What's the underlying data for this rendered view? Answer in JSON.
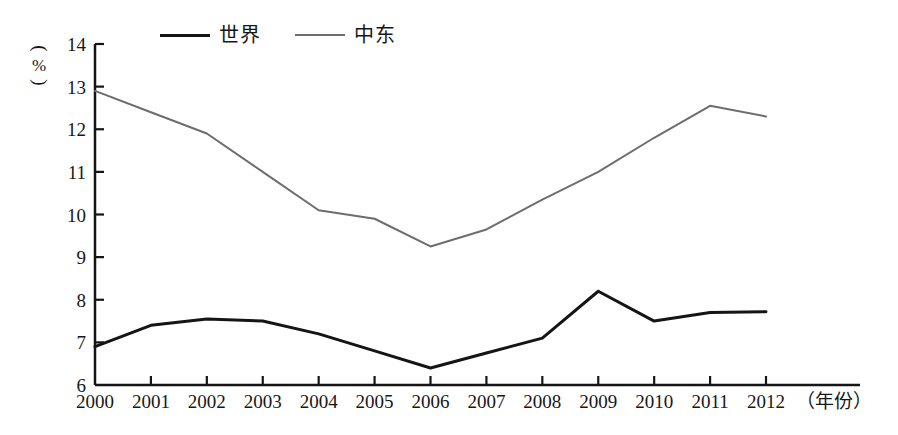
{
  "chart_data": {
    "type": "line",
    "title": "",
    "subtitle": "",
    "xlabel": "（年份）",
    "ylabel": "（%）",
    "ylim": [
      6,
      14
    ],
    "yticks": [
      6,
      7,
      8,
      9,
      10,
      11,
      12,
      13,
      14
    ],
    "ytick_labels": [
      "6",
      "7",
      "8",
      "9",
      "10",
      "11",
      "12",
      "13",
      "14"
    ],
    "grid": false,
    "legend_position": "top-center",
    "categories": [
      "2000",
      "2001",
      "2002",
      "2003",
      "2004",
      "2005",
      "2006",
      "2007",
      "2008",
      "2009",
      "2010",
      "2011",
      "2012"
    ],
    "x": [
      2000,
      2001,
      2002,
      2003,
      2004,
      2005,
      2006,
      2007,
      2008,
      2009,
      2010,
      2011,
      2012
    ],
    "series": [
      {
        "name": "世界",
        "color": "#151515",
        "line_width": 3,
        "values": [
          6.9,
          7.4,
          7.55,
          7.5,
          7.2,
          6.8,
          6.4,
          6.75,
          7.1,
          8.2,
          7.5,
          7.7,
          7.72
        ]
      },
      {
        "name": "中东",
        "color": "#6d6d6d",
        "line_width": 2,
        "values": [
          12.9,
          12.4,
          11.9,
          11.0,
          10.1,
          9.9,
          9.25,
          9.65,
          10.35,
          11.0,
          11.8,
          12.55,
          12.3
        ]
      }
    ]
  },
  "legend": {
    "entries": [
      {
        "label": "世界"
      },
      {
        "label": "中东"
      }
    ]
  },
  "axis": {
    "y_unit_open_paren": "︵",
    "y_unit_symbol": "%",
    "y_unit_close_paren": "︶",
    "x_title": "（年份）"
  },
  "colors": {
    "world_line": "#151515",
    "mideast_line": "#6d6d6d",
    "axis": "#151515",
    "background": "#ffffff",
    "text": "#171717"
  }
}
